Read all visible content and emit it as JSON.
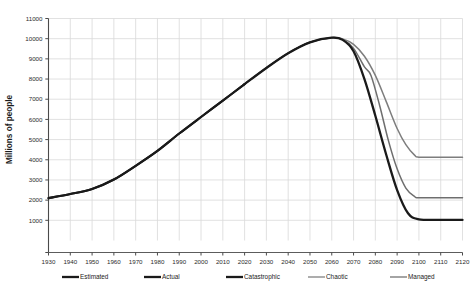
{
  "chart_data": {
    "type": "line",
    "title": "",
    "xlabel": "",
    "ylabel": "Millions of people",
    "xlim": [
      1930,
      2120
    ],
    "ylim": [
      0,
      11000
    ],
    "grid": true,
    "legend_position": "bottom",
    "x_ticks": [
      1930,
      1940,
      1950,
      1960,
      1970,
      1980,
      1990,
      2000,
      2010,
      2020,
      2030,
      2040,
      2050,
      2060,
      2070,
      2080,
      2090,
      2100,
      2110,
      2120
    ],
    "y_ticks": [
      0,
      1000,
      2000,
      3000,
      4000,
      5000,
      6000,
      7000,
      8000,
      9000,
      10000,
      11000
    ],
    "y_tick_labels": [
      "",
      "1000",
      "2000",
      "3000",
      "4000",
      "5000",
      "6000",
      "7000",
      "8000",
      "9000",
      "10000",
      "11000"
    ],
    "series": [
      {
        "name": "Estimated",
        "color": "#1a1a1a",
        "width": 2.1,
        "x": [
          1930,
          1940,
          1950,
          1960,
          1970,
          1980,
          1990,
          2000,
          2010,
          2020
        ],
        "values": [
          2100,
          2300,
          2550,
          3020,
          3700,
          4440,
          5300,
          6120,
          6930,
          7750
        ]
      },
      {
        "name": "Actual",
        "color": "#1a1a1a",
        "width": 2.1,
        "x": [
          1930,
          1940,
          1950,
          1960,
          1970,
          1980,
          1990,
          2000,
          2010,
          2020
        ],
        "values": [
          2100,
          2300,
          2550,
          3020,
          3700,
          4440,
          5300,
          6120,
          6930,
          7750
        ]
      },
      {
        "name": "Catastrophic",
        "color": "#1a1a1a",
        "width": 2.3,
        "x": [
          2020,
          2030,
          2040,
          2050,
          2060,
          2065,
          2070,
          2075,
          2080,
          2085,
          2090,
          2095,
          2100,
          2110,
          2120
        ],
        "values": [
          7750,
          8550,
          9280,
          9820,
          10050,
          9940,
          9380,
          8000,
          6180,
          4250,
          2500,
          1350,
          1050,
          1020,
          1020
        ]
      },
      {
        "name": "Chaotic",
        "color": "#6e6e6e",
        "width": 1.5,
        "x": [
          2020,
          2030,
          2040,
          2050,
          2060,
          2065,
          2070,
          2075,
          2078,
          2082,
          2086,
          2090,
          2094,
          2098,
          2100,
          2110,
          2120
        ],
        "values": [
          7750,
          8550,
          9280,
          9820,
          10050,
          9960,
          9520,
          8600,
          8180,
          6680,
          4950,
          3550,
          2600,
          2180,
          2120,
          2120,
          2120
        ]
      },
      {
        "name": "Managed",
        "color": "#7d7d7d",
        "width": 1.5,
        "x": [
          2020,
          2030,
          2040,
          2050,
          2060,
          2065,
          2070,
          2075,
          2080,
          2085,
          2090,
          2094,
          2098,
          2100,
          2110,
          2120
        ],
        "values": [
          7750,
          8550,
          9280,
          9820,
          10050,
          9990,
          9720,
          9130,
          8180,
          6880,
          5550,
          4750,
          4230,
          4130,
          4130,
          4130
        ]
      }
    ],
    "annotations": []
  },
  "legend": {
    "items": [
      {
        "label": "Estimated",
        "color": "#1a1a1a",
        "width": 2.3
      },
      {
        "label": "Actual",
        "color": "#1a1a1a",
        "width": 2.3
      },
      {
        "label": "Catastrophic",
        "color": "#1a1a1a",
        "width": 2.3
      },
      {
        "label": "Chaotic",
        "color": "#8a8a8a",
        "width": 1.4
      },
      {
        "label": "Managed",
        "color": "#7d7d7d",
        "width": 1.4
      }
    ]
  },
  "colors": {
    "background": "#ffffff",
    "gridline": "#d9d9d9",
    "axis": "#4a4a4a",
    "text": "#2b2b2b"
  }
}
